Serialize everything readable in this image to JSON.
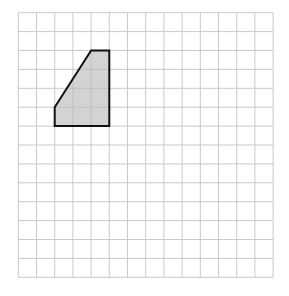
{
  "diagram": {
    "type": "grid-shape",
    "grid": {
      "columns": 14,
      "rows": 14,
      "origin_x": 18.3,
      "origin_y": 12.7,
      "cell_width": 18.2,
      "cell_height": 18.9,
      "line_color": "#c9c9c9"
    },
    "shape": {
      "name": "trapezoid",
      "vertices": [
        [
          4,
          2
        ],
        [
          5,
          2
        ],
        [
          5,
          6
        ],
        [
          2,
          6
        ],
        [
          2,
          5
        ]
      ],
      "fill_color": "#d3d3d3",
      "stroke_color": "#111111",
      "stroke_width": 2
    }
  }
}
